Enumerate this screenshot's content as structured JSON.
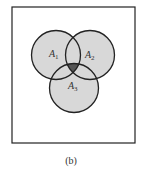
{
  "figure": {
    "caption": "(b)",
    "universe_box": {
      "x": 12,
      "y": 7,
      "width": 123,
      "height": 136
    },
    "colors": {
      "background": "#ffffff",
      "stroke": "#222222",
      "set_fill": "#d8d8d8",
      "intersection_fill": "#555555"
    },
    "sets": [
      {
        "id": "A1",
        "base": "A",
        "sub": "1",
        "cx": 56,
        "cy": 55,
        "r": 24.5,
        "label_x": 49,
        "label_y": 57
      },
      {
        "id": "A2",
        "base": "A",
        "sub": "2",
        "cx": 90,
        "cy": 55,
        "r": 24.5,
        "label_x": 85,
        "label_y": 58
      },
      {
        "id": "A3",
        "base": "A",
        "sub": "3",
        "cx": 74,
        "cy": 88,
        "r": 24.5,
        "label_x": 68,
        "label_y": 89
      }
    ],
    "highlighted_region": "A1 ∩ A2 ∩ A3"
  }
}
